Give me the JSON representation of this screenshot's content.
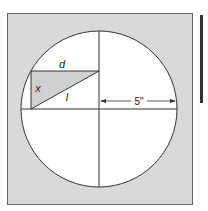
{
  "diagram": {
    "type": "geometry",
    "labels": {
      "d": "d",
      "x": "x",
      "l": "l",
      "radius": "5\""
    },
    "colors": {
      "background_square": "#d9d9d9",
      "circle_fill": "#ffffff",
      "triangle_fill": "#d0d0d0",
      "stroke": "#333333",
      "side_bar": "#333333"
    }
  }
}
